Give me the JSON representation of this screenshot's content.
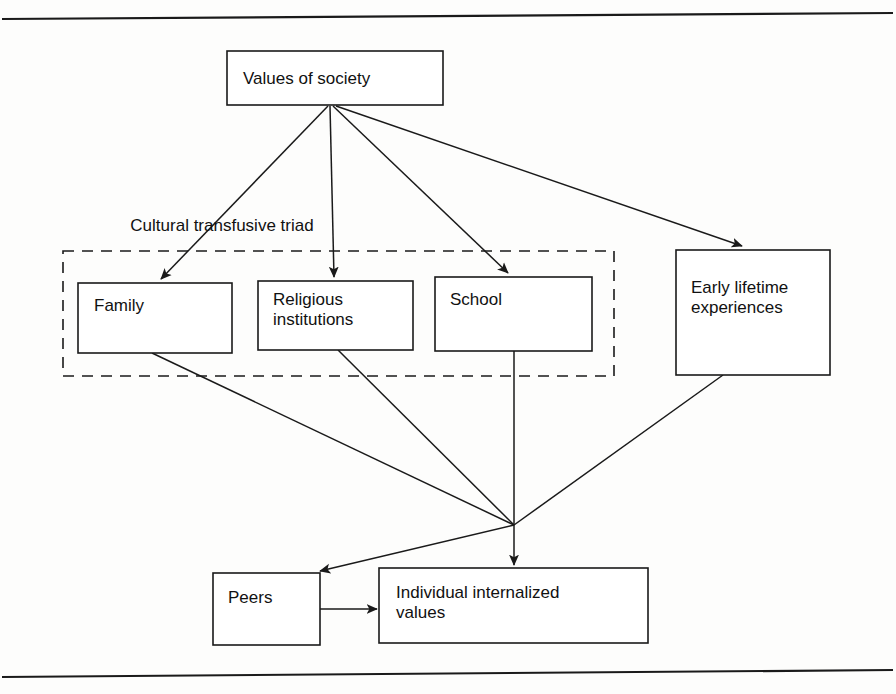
{
  "figure": {
    "type": "flow-diagram",
    "title_rule_top": "horizontal-rule",
    "title_rule_bottom": "horizontal-rule"
  },
  "nodes": {
    "values_of_society": {
      "label": "Values of society",
      "x": 227,
      "y": 51,
      "w": 216,
      "h": 54
    },
    "family": {
      "label": "Family",
      "x": 78,
      "y": 283,
      "w": 154,
      "h": 70
    },
    "religious_institutions": {
      "label_line1": "Religious",
      "label_line2": "institutions",
      "x": 258,
      "y": 281,
      "w": 155,
      "h": 69
    },
    "school": {
      "label": "School",
      "x": 435,
      "y": 277,
      "w": 157,
      "h": 74
    },
    "early_lifetime": {
      "label_line1": "Early lifetime",
      "label_line2": "experiences",
      "x": 676,
      "y": 250,
      "w": 154,
      "h": 125
    },
    "peers": {
      "label": "Peers",
      "x": 213,
      "y": 573,
      "w": 107,
      "h": 72
    },
    "individual_values": {
      "label_line1": "Individual internalized",
      "label_line2": "values",
      "x": 379,
      "y": 568,
      "w": 269,
      "h": 75
    }
  },
  "group": {
    "label": "Cultural transfusive triad",
    "x": 63,
    "y": 251,
    "w": 551,
    "h": 125,
    "style": "dashed"
  },
  "edges": [
    {
      "from": "values_of_society",
      "to": "family",
      "arrowhead": true
    },
    {
      "from": "values_of_society",
      "to": "religious_institutions",
      "arrowhead": true
    },
    {
      "from": "values_of_society",
      "to": "school",
      "arrowhead": true
    },
    {
      "from": "values_of_society",
      "to": "early_lifetime",
      "arrowhead": true
    },
    {
      "from": "family",
      "to": "junction",
      "arrowhead": false
    },
    {
      "from": "religious_institutions",
      "to": "junction",
      "arrowhead": false
    },
    {
      "from": "school",
      "to": "junction",
      "arrowhead": false
    },
    {
      "from": "early_lifetime",
      "to": "junction",
      "arrowhead": false
    },
    {
      "from": "junction",
      "to": "individual_values",
      "arrowhead": true
    },
    {
      "from": "junction",
      "to": "peers",
      "arrowhead": true
    },
    {
      "from": "peers",
      "to": "individual_values",
      "arrowhead": true
    }
  ],
  "junction": {
    "x": 514,
    "y": 525
  },
  "colors": {
    "stroke": "#1a1a1a",
    "background": "#fdfdfc",
    "text": "#111111"
  }
}
